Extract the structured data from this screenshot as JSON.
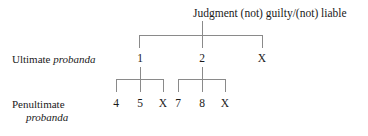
{
  "diagram": {
    "title": "Judgment (not) guilty/(not) liable",
    "rows": {
      "ultimate": {
        "text_plain": "Ultimate ",
        "text_italic": "probanda"
      },
      "penultimate": {
        "line1": "Penultimate",
        "line2": "probanda"
      }
    },
    "ultimate_nodes": [
      {
        "label": "1"
      },
      {
        "label": "2"
      },
      {
        "label": "X"
      }
    ],
    "penultimate_nodes": [
      {
        "label": "4"
      },
      {
        "label": "5"
      },
      {
        "label": "X"
      },
      {
        "label": "7"
      },
      {
        "label": "8"
      },
      {
        "label": "X"
      }
    ],
    "colors": {
      "line": "#8a8a8a",
      "text": "#1a1a1a",
      "background": "#ffffff"
    }
  }
}
